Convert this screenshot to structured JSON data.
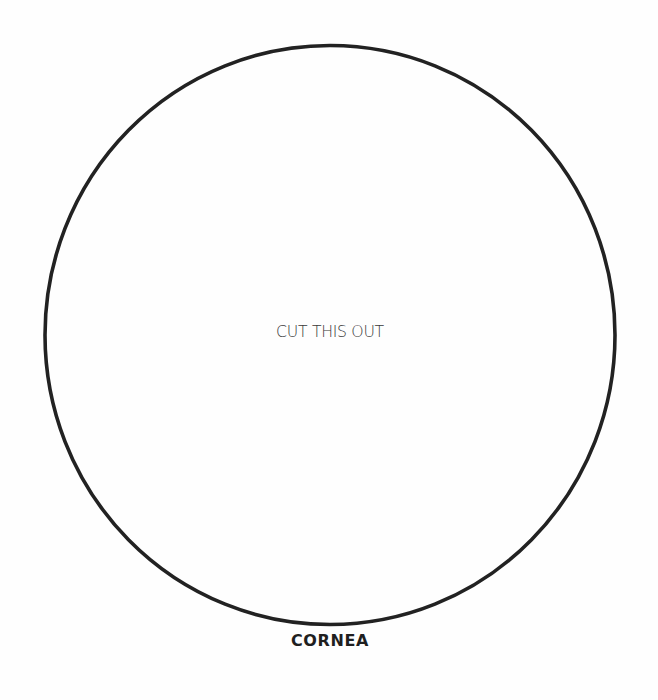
{
  "cutout": {
    "shape": "circle",
    "center": [
      330,
      335
    ],
    "radius": [
      285,
      289
    ],
    "stroke_color": "#222222",
    "stroke_width": 3.5,
    "instruction": "CUT THIS OUT"
  },
  "caption": "CORNEA"
}
